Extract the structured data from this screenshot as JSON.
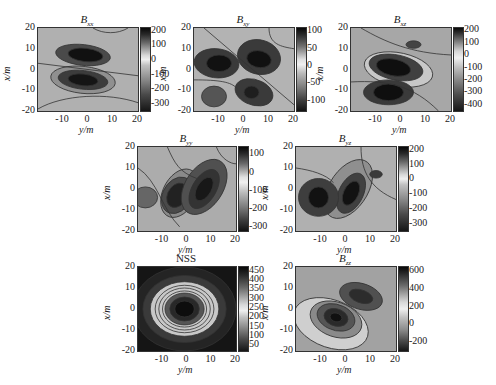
{
  "figure": {
    "panel_count": 7,
    "layout": "3 rows: 3 panels, 2 panels, 2 panels"
  },
  "chart_data": [
    {
      "id": "bxx",
      "type": "heatmap",
      "title": "B",
      "title_sub": "xx",
      "xlabel": "y/m",
      "ylabel": "x/m",
      "xlim": [
        -20,
        20
      ],
      "ylim": [
        -20,
        20
      ],
      "xticks": [
        "-10",
        "0",
        "10",
        "20"
      ],
      "yticks": [
        "20",
        "10",
        "0",
        "-10",
        "-20"
      ],
      "colorbar_ticks": [
        "200",
        "100",
        "0",
        "-100",
        "-200",
        "-300"
      ],
      "colorbar_range": [
        -350,
        220
      ],
      "features": [
        {
          "kind": "minimum",
          "x": 7,
          "y": -1,
          "value": -300
        },
        {
          "kind": "minimum",
          "x": -5,
          "y": -2,
          "value": -300
        }
      ]
    },
    {
      "id": "bxy",
      "type": "heatmap",
      "title": "B",
      "title_sub": "xy",
      "xlabel": "y/m",
      "ylabel": "x/m",
      "xlim": [
        -20,
        20
      ],
      "ylim": [
        -20,
        20
      ],
      "xticks": [
        "-10",
        "0",
        "10",
        "20"
      ],
      "yticks": [
        "20",
        "10",
        "0",
        "-10",
        "-20"
      ],
      "colorbar_ticks": [
        "100",
        "50",
        "0",
        "-50",
        "-100"
      ],
      "colorbar_range": [
        -130,
        110
      ],
      "features": [
        {
          "kind": "minimum",
          "x": 3,
          "y": -11,
          "value": -120
        },
        {
          "kind": "minimum",
          "x": 5,
          "y": 5,
          "value": -120
        },
        {
          "kind": "minimum",
          "x": -10,
          "y": 4,
          "value": -120
        },
        {
          "kind": "minimum",
          "x": 3,
          "y": -11,
          "value": -100
        },
        {
          "kind": "minimum",
          "x": -13,
          "y": -13,
          "value": -60
        }
      ]
    },
    {
      "id": "bxz",
      "type": "heatmap",
      "title": "B",
      "title_sub": "xz",
      "xlabel": "y/m",
      "ylabel": "x/m",
      "xlim": [
        -20,
        20
      ],
      "ylim": [
        -20,
        20
      ],
      "xticks": [
        "-10",
        "0",
        "10",
        "20"
      ],
      "yticks": [
        "20",
        "10",
        "0",
        "-10",
        "-20"
      ],
      "colorbar_ticks": [
        "200",
        "100",
        "0",
        "-100",
        "-200",
        "-300",
        "-400"
      ],
      "colorbar_range": [
        -450,
        220
      ],
      "features": [
        {
          "kind": "minimum",
          "x": -3,
          "y": 1,
          "value": -400
        },
        {
          "kind": "minimum",
          "x": -5,
          "y": -11,
          "value": -400
        },
        {
          "kind": "minimum",
          "x": 5,
          "y": 12,
          "value": -250
        }
      ]
    },
    {
      "id": "byy",
      "type": "heatmap",
      "title": "B",
      "title_sub": "yy",
      "xlabel": "y/m",
      "ylabel": "x/m",
      "xlim": [
        -20,
        20
      ],
      "ylim": [
        -20,
        20
      ],
      "xticks": [
        "-10",
        "0",
        "10",
        "20"
      ],
      "yticks": [
        "20",
        "10",
        "0",
        "-10",
        "-20"
      ],
      "colorbar_ticks": [
        "100",
        "0",
        "-100",
        "-200",
        "-300"
      ],
      "colorbar_range": [
        -320,
        140
      ],
      "features": [
        {
          "kind": "minimum",
          "x": -4,
          "y": -3,
          "value": -300
        },
        {
          "kind": "minimum",
          "x": 7,
          "y": 0,
          "value": -300
        },
        {
          "kind": "minimum",
          "x": -17,
          "y": -4,
          "value": -150
        }
      ]
    },
    {
      "id": "byz",
      "type": "heatmap",
      "title": "B",
      "title_sub": "yz",
      "xlabel": "y/m",
      "ylabel": "x/m",
      "xlim": [
        -20,
        20
      ],
      "ylim": [
        -20,
        20
      ],
      "xticks": [
        "-10",
        "0",
        "10",
        "20"
      ],
      "yticks": [
        "20",
        "10",
        "0",
        "-10",
        "-20"
      ],
      "colorbar_ticks": [
        "200",
        "100",
        "0",
        "-100",
        "-200",
        "-300"
      ],
      "colorbar_range": [
        -350,
        220
      ],
      "features": [
        {
          "kind": "minimum",
          "x": -11,
          "y": -4,
          "value": -300
        },
        {
          "kind": "minimum",
          "x": 2,
          "y": -2,
          "value": -300
        },
        {
          "kind": "minimum",
          "x": 12,
          "y": 7,
          "value": -250
        }
      ]
    },
    {
      "id": "nss",
      "type": "heatmap",
      "title": "NSS",
      "title_sub": "",
      "xlabel": "y/m",
      "ylabel": "x/m",
      "xlim": [
        -20,
        20
      ],
      "ylim": [
        -20,
        20
      ],
      "xticks": [
        "-10",
        "0",
        "10",
        "20"
      ],
      "yticks": [
        "20",
        "10",
        "0",
        "-10",
        "-20"
      ],
      "colorbar_ticks": [
        "450",
        "400",
        "350",
        "300",
        "250",
        "200",
        "150",
        "100",
        "50"
      ],
      "colorbar_range": [
        20,
        470
      ],
      "features": [
        {
          "kind": "maximum",
          "x": -1,
          "y": 0,
          "value": 450
        },
        {
          "kind": "ring",
          "x": -1,
          "y": 0,
          "radius": 10,
          "value": 250
        }
      ]
    },
    {
      "id": "bzz",
      "type": "heatmap",
      "title": "B",
      "title_sub": "zz",
      "xlabel": "y/m",
      "ylabel": "x/m",
      "xlim": [
        -20,
        20
      ],
      "ylim": [
        -20,
        20
      ],
      "xticks": [
        "-10",
        "0",
        "10",
        "20"
      ],
      "yticks": [
        "20",
        "10",
        "0",
        "-10",
        "-20"
      ],
      "colorbar_ticks": [
        "600",
        "400",
        "200",
        "0",
        "-200"
      ],
      "colorbar_range": [
        -300,
        650
      ],
      "features": [
        {
          "kind": "maximum",
          "x": -4,
          "y": -4,
          "value": 600
        },
        {
          "kind": "minimum",
          "x": 5,
          "y": 7,
          "value": 500
        },
        {
          "kind": "plateau",
          "x": -8,
          "y": -6,
          "value": 150
        }
      ]
    }
  ]
}
